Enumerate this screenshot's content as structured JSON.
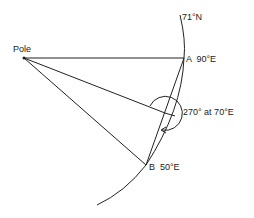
{
  "diagram": {
    "labels": {
      "pole": "Pole",
      "point_a": "A  90°E",
      "point_b": "B  50°E",
      "latitude": "71°N",
      "course": "270° at 70°E"
    },
    "points": {
      "pole": [
        24,
        58
      ],
      "a": [
        184,
        58
      ],
      "b": [
        146,
        165
      ],
      "mid": [
        165,
        113
      ]
    },
    "colors": {
      "ink": "#222222",
      "background": "#ffffff"
    }
  }
}
